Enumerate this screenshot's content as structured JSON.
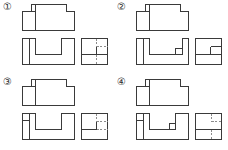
{
  "figure": {
    "kind": "orthographic-projection-multiple-choice",
    "columns": 2,
    "rows": 2,
    "line_colors": {
      "visible_edge": "#3a3a3a",
      "hidden_edge": "#8c8c8c",
      "background": "#ffffff",
      "label_text": "#2b2b2b"
    },
    "view_names": [
      "top-view",
      "front-view",
      "side-view"
    ]
  },
  "options": [
    {
      "label": "①",
      "id": "option-1",
      "top_view": {
        "outline": "rect 0,2 52x26 with notch top-left 0,2 9x7 and notch top-right 44,2 8x7",
        "internal_lines": [
          "vertical at x=13 from y=2 to y=28",
          "horizontal at y=9 from x=0 to x=13"
        ]
      },
      "front_view": {
        "outline": "U-shaped: rect 0,0 52x26 with rectangular cut 13,0 to 39,17",
        "internal_lines": [
          "vertical at x=7 from y=0 to y=26"
        ]
      },
      "side_view": {
        "outline": "rect 0,0 26x26",
        "visible_lines": [
          "horizontal at y=16 from x=0 to x=26",
          "vertical at x=15 from y=8 to y=16"
        ],
        "hidden_lines": [
          "vertical dashed at x=15 from y=0 to y=8",
          "horizontal dashed at y=8 from x=15 to x=26",
          "vertical dashed at x=15 from y=16 to y=26"
        ]
      }
    },
    {
      "label": "②",
      "id": "option-2",
      "top_view": {
        "outline": "rect 0,2 52x26 with notch top-left 0,2 9x7 and notch top-right 44,2 8x7",
        "internal_lines": [
          "vertical at x=13 from y=2 to y=28",
          "horizontal at y=9 from x=0 to x=13"
        ]
      },
      "front_view": {
        "outline": "U-shaped: rect 0,0 52x26 with rectangular cut 13,0 to 39,17, plus small raised block 39,11 to 46,17",
        "internal_lines": [
          "vertical at x=7 from y=0 to y=26",
          "vertical at x=46 from y=11 to y=17"
        ]
      },
      "side_view": {
        "outline": "rect 0,0 26x26",
        "visible_lines": [
          "horizontal at y=16 from x=0 to x=26",
          "vertical at x=15 from y=8 to y=16",
          "horizontal at y=8 from x=15 to x=26"
        ],
        "hidden_lines": []
      }
    },
    {
      "label": "③",
      "id": "option-3",
      "top_view": {
        "outline": "rect 0,2 52x26 with notch top-left 0,2 9x7 and notch top-right 44,2 8x7",
        "internal_lines": [
          "vertical at x=13 from y=2 to y=28",
          "horizontal at y=9 from x=0 to x=13"
        ]
      },
      "front_view": {
        "outline": "U-shaped: rect 0,0 52x26 with rectangular cut 13,0 to 39,17",
        "internal_lines": [
          "vertical at x=7 from y=0 to y=26",
          "horizontal at y=8 from x=0 to x=7"
        ]
      },
      "side_view": {
        "outline": "rect 0,0 26x26",
        "visible_lines": [
          "horizontal at y=16 from x=0 to x=15",
          "vertical at x=15 from y=8 to y=16"
        ],
        "hidden_lines": [
          "vertical dashed at x=15 from y=0 to y=8",
          "horizontal dashed at y=8 from x=15 to x=26",
          "horizontal dashed at y=16 from x=15 to x=26"
        ]
      }
    },
    {
      "label": "④",
      "id": "option-4",
      "top_view": {
        "outline": "rect 0,2 52x26 with notch top-left 0,2 9x7 and notch top-right 44,2 8x7",
        "internal_lines": [
          "vertical at x=13 from y=2 to y=28",
          "horizontal at y=9 from x=0 to x=13"
        ]
      },
      "front_view": {
        "outline": "U-shaped: rect 0,0 52x26 with rectangular cut 13,0 to 39,17, plus small raised block 33,11 to 39,17",
        "internal_lines": [
          "vertical at x=7 from y=0 to y=26",
          "horizontal at y=8 from x=0 to x=7"
        ]
      },
      "side_view": {
        "outline": "rect 0,0 26x26",
        "visible_lines": [
          "horizontal at y=16 from x=0 to x=26"
        ],
        "hidden_lines": [
          "vertical dashed at x=16 from y=0 to y=8",
          "horizontal dashed at y=8 from x=16 to x=26",
          "vertical dashed at x=16 from y=16 to y=26"
        ]
      }
    }
  ]
}
